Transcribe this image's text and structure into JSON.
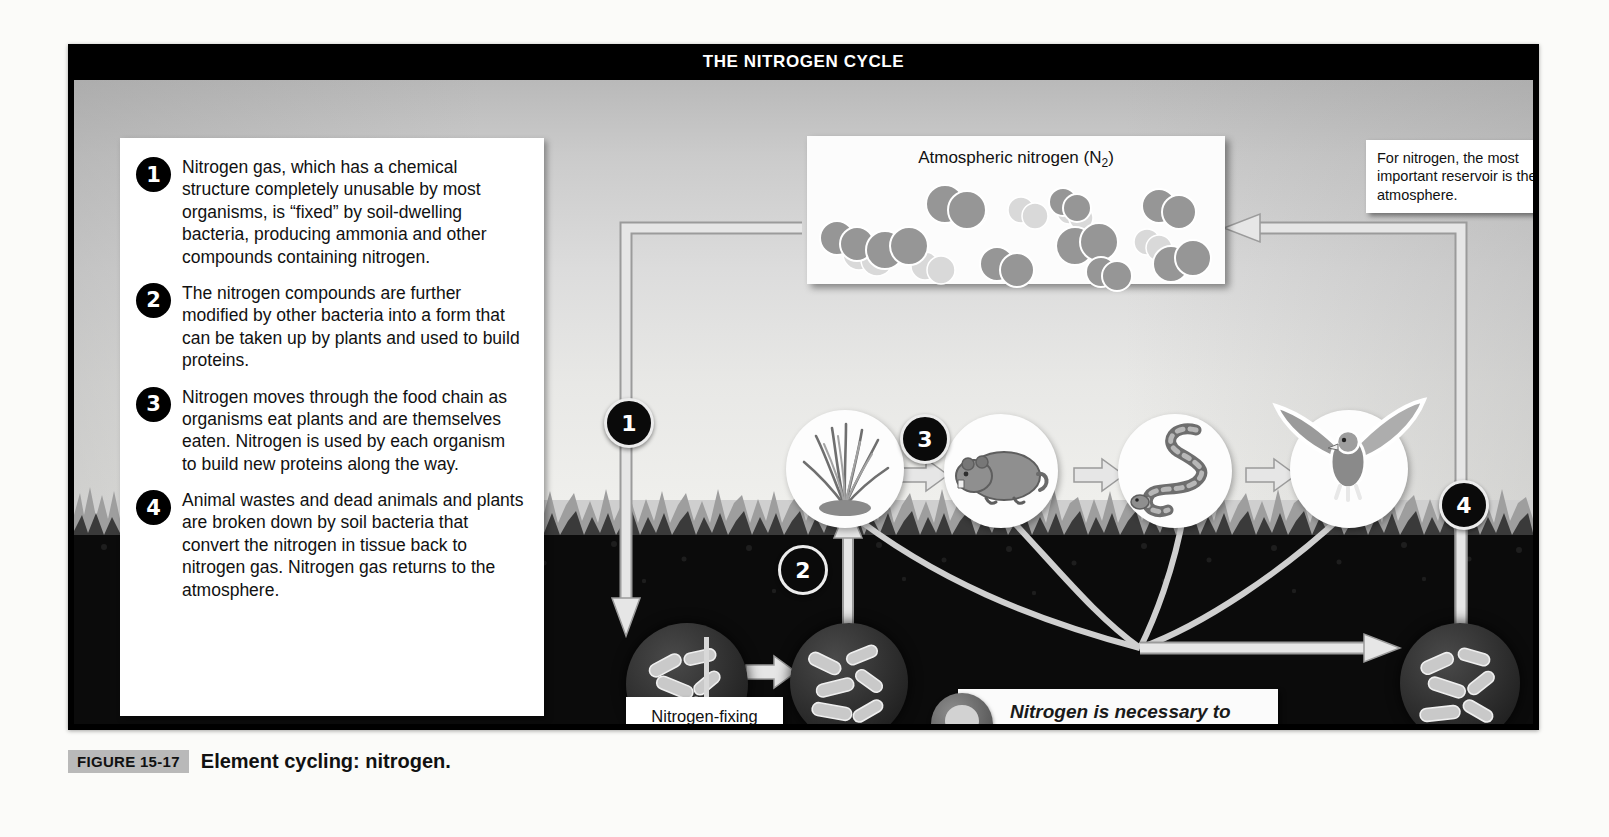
{
  "figure": {
    "title": "THE NITROGEN CYCLE",
    "caption_badge": "FIGURE 15-17",
    "caption_title": "Element cycling: nitrogen."
  },
  "steps": [
    {
      "number": "1",
      "text": "Nitrogen gas, which has a chemical structure completely unusable by most organisms, is “fixed” by soil-dwelling bacteria, producing ammonia and other compounds containing nitrogen."
    },
    {
      "number": "2",
      "text": "The nitrogen compounds are further modified by other bacteria into a form that can be taken up by plants and used to build proteins."
    },
    {
      "number": "3",
      "text": "Nitrogen moves through the food chain as organisms eat plants and are themselves eaten. Nitrogen is used by each organism to build new proteins along the way."
    },
    {
      "number": "4",
      "text": "Animal wastes and dead animals and plants are broken down by soil bacteria that convert the nitrogen in tissue back to nitrogen gas. Nitrogen gas returns to the atmosphere."
    }
  ],
  "atmosphere": {
    "label_main": "Atmospheric nitrogen (N",
    "label_sub": "2",
    "label_close": ")",
    "molecule_count": 13
  },
  "callouts": {
    "reservoir": "For nitrogen, the most important reservoir is the atmosphere.",
    "nitrogen_fixing_bacteria": "Nitrogen-fixing bacteria",
    "tip": "Nitrogen is necessary to build all amino acids, the components of every protein molecule.",
    "tip_icon": "lightbulb-icon"
  },
  "diagram_markers": [
    {
      "number": "1"
    },
    {
      "number": "2"
    },
    {
      "number": "3"
    },
    {
      "number": "4"
    }
  ],
  "food_chain": [
    {
      "name": "grass-plant"
    },
    {
      "name": "rodent"
    },
    {
      "name": "snake"
    },
    {
      "name": "hawk"
    }
  ],
  "soil_microbes": [
    {
      "name": "nitrogen-fixing-bacteria-colony-1"
    },
    {
      "name": "nitrogen-fixing-bacteria-colony-2"
    },
    {
      "name": "decomposer-bacteria-colony"
    }
  ],
  "colors": {
    "frame": "#000000",
    "title_text": "#ffffff",
    "sky": "#dcdcdc",
    "soil": "#0b0b0b",
    "pipe": "#e2e2e2",
    "badge_gray": "#b9b9b9",
    "molecule_dark": "#8c8c8c",
    "molecule_light": "#cfcfcf"
  }
}
